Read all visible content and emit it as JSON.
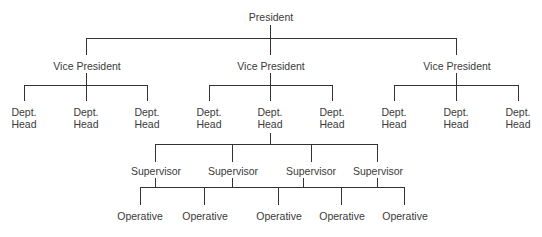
{
  "diagram": {
    "type": "organization-chart",
    "line_color": "#333333",
    "text_color": "#3a3a3a",
    "background": "#ffffff",
    "president": {
      "label": "President"
    },
    "vice_presidents": [
      {
        "label": "Vice President",
        "dept_heads": [
          {
            "line1": "Dept.",
            "line2": "Head"
          },
          {
            "line1": "Dept.",
            "line2": "Head"
          },
          {
            "line1": "Dept.",
            "line2": "Head"
          }
        ]
      },
      {
        "label": "Vice President",
        "dept_heads": [
          {
            "line1": "Dept.",
            "line2": "Head"
          },
          {
            "line1": "Dept.",
            "line2": "Head"
          },
          {
            "line1": "Dept.",
            "line2": "Head"
          }
        ]
      },
      {
        "label": "Vice President",
        "dept_heads": [
          {
            "line1": "Dept.",
            "line2": "Head"
          },
          {
            "line1": "Dept.",
            "line2": "Head"
          },
          {
            "line1": "Dept.",
            "line2": "Head"
          }
        ]
      }
    ],
    "supervisors": [
      {
        "label": "Supervisor"
      },
      {
        "label": "Supervisor"
      },
      {
        "label": "Supervisor"
      },
      {
        "label": "Supervisor"
      }
    ],
    "operatives": [
      {
        "label": "Operative"
      },
      {
        "label": "Operative"
      },
      {
        "label": "Operative"
      },
      {
        "label": "Operative"
      },
      {
        "label": "Operative"
      }
    ]
  }
}
